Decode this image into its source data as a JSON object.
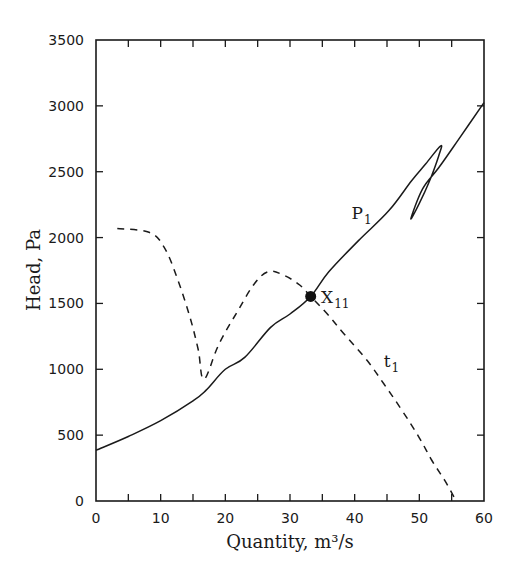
{
  "chart_data": {
    "type": "line",
    "title": "",
    "xlabel": "Quantity, m³/s",
    "ylabel": "Head, Pa",
    "xlim": [
      0,
      60
    ],
    "ylim": [
      0,
      3500
    ],
    "x_ticks": [
      0,
      10,
      20,
      30,
      40,
      50,
      60
    ],
    "x_tick_labels": [
      "0",
      "10",
      "20",
      "30",
      "40",
      "50",
      "60"
    ],
    "x_minor_step": 5,
    "y_ticks": [
      0,
      500,
      1000,
      1500,
      2000,
      2500,
      3000,
      3500
    ],
    "y_tick_labels": [
      "0",
      "500",
      "1000",
      "1500",
      "2000",
      "2500",
      "3000",
      "3500"
    ],
    "grid": false,
    "legend": "none",
    "series": [
      {
        "name": "P1",
        "label_main": "P",
        "label_sub": "1",
        "style": "solid",
        "x": [
          0,
          5,
          10,
          15,
          17,
          20,
          23,
          27,
          30,
          33.2,
          36,
          40.6,
          45.3,
          48.8,
          51,
          53.3,
          53.0,
          51.5,
          50.0,
          48.7,
          50.5,
          53,
          56,
          60
        ],
        "y": [
          385,
          490,
          610,
          760,
          840,
          1000,
          1090,
          1318,
          1420,
          1553,
          1740,
          1977,
          2205,
          2432,
          2560,
          2697,
          2620,
          2420,
          2260,
          2144,
          2370,
          2530,
          2740,
          3025
        ]
      },
      {
        "name": "t1",
        "label_main": "t",
        "label_sub": "1",
        "style": "dashed",
        "x": [
          3.3,
          8.2,
          10.5,
          12.5,
          14.5,
          15.8,
          16.7,
          19,
          22,
          24.5,
          26.7,
          29,
          31.5,
          33.2,
          35.7,
          38.5,
          41.9,
          44.5,
          47.3,
          50,
          51.9,
          54,
          55.7
        ],
        "y": [
          2068,
          2040,
          1930,
          1700,
          1400,
          1150,
          924,
          1190,
          1450,
          1650,
          1742,
          1715,
          1640,
          1553,
          1424,
          1260,
          1068,
          890,
          689,
          480,
          311,
          150,
          0
        ]
      }
    ],
    "annotations": [
      {
        "text_main": "X",
        "text_sub": "11",
        "x": 33.2,
        "y": 1553,
        "marker": "filled-circle",
        "description": "intersection point of P1 and t1"
      }
    ],
    "label_positions": {
      "P1": {
        "x": 39.5,
        "y": 2140
      },
      "t1": {
        "x": 44.5,
        "y": 1020
      },
      "X11": {
        "x": 34.8,
        "y": 1500
      }
    }
  }
}
